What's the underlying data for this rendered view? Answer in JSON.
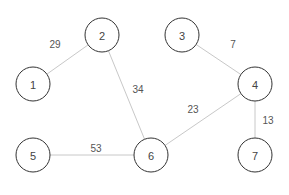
{
  "graph": {
    "nodes": [
      {
        "id": "1",
        "label": "1",
        "x": 33,
        "y": 84
      },
      {
        "id": "2",
        "label": "2",
        "x": 102,
        "y": 35
      },
      {
        "id": "3",
        "label": "3",
        "x": 182,
        "y": 35
      },
      {
        "id": "4",
        "label": "4",
        "x": 255,
        "y": 84
      },
      {
        "id": "5",
        "label": "5",
        "x": 33,
        "y": 155
      },
      {
        "id": "6",
        "label": "6",
        "x": 151,
        "y": 155
      },
      {
        "id": "7",
        "label": "7",
        "x": 255,
        "y": 155
      }
    ],
    "edges": [
      {
        "from": "1",
        "to": "2",
        "weight": "29",
        "lx": 55,
        "ly": 44
      },
      {
        "from": "2",
        "to": "6",
        "weight": "34",
        "lx": 138,
        "ly": 89
      },
      {
        "from": "3",
        "to": "4",
        "weight": "7",
        "lx": 233,
        "ly": 44
      },
      {
        "from": "4",
        "to": "6",
        "weight": "23",
        "lx": 193,
        "ly": 109
      },
      {
        "from": "4",
        "to": "7",
        "weight": "13",
        "lx": 268,
        "ly": 120
      },
      {
        "from": "5",
        "to": "6",
        "weight": "53",
        "lx": 96,
        "ly": 148
      }
    ],
    "node_radius": 17
  }
}
